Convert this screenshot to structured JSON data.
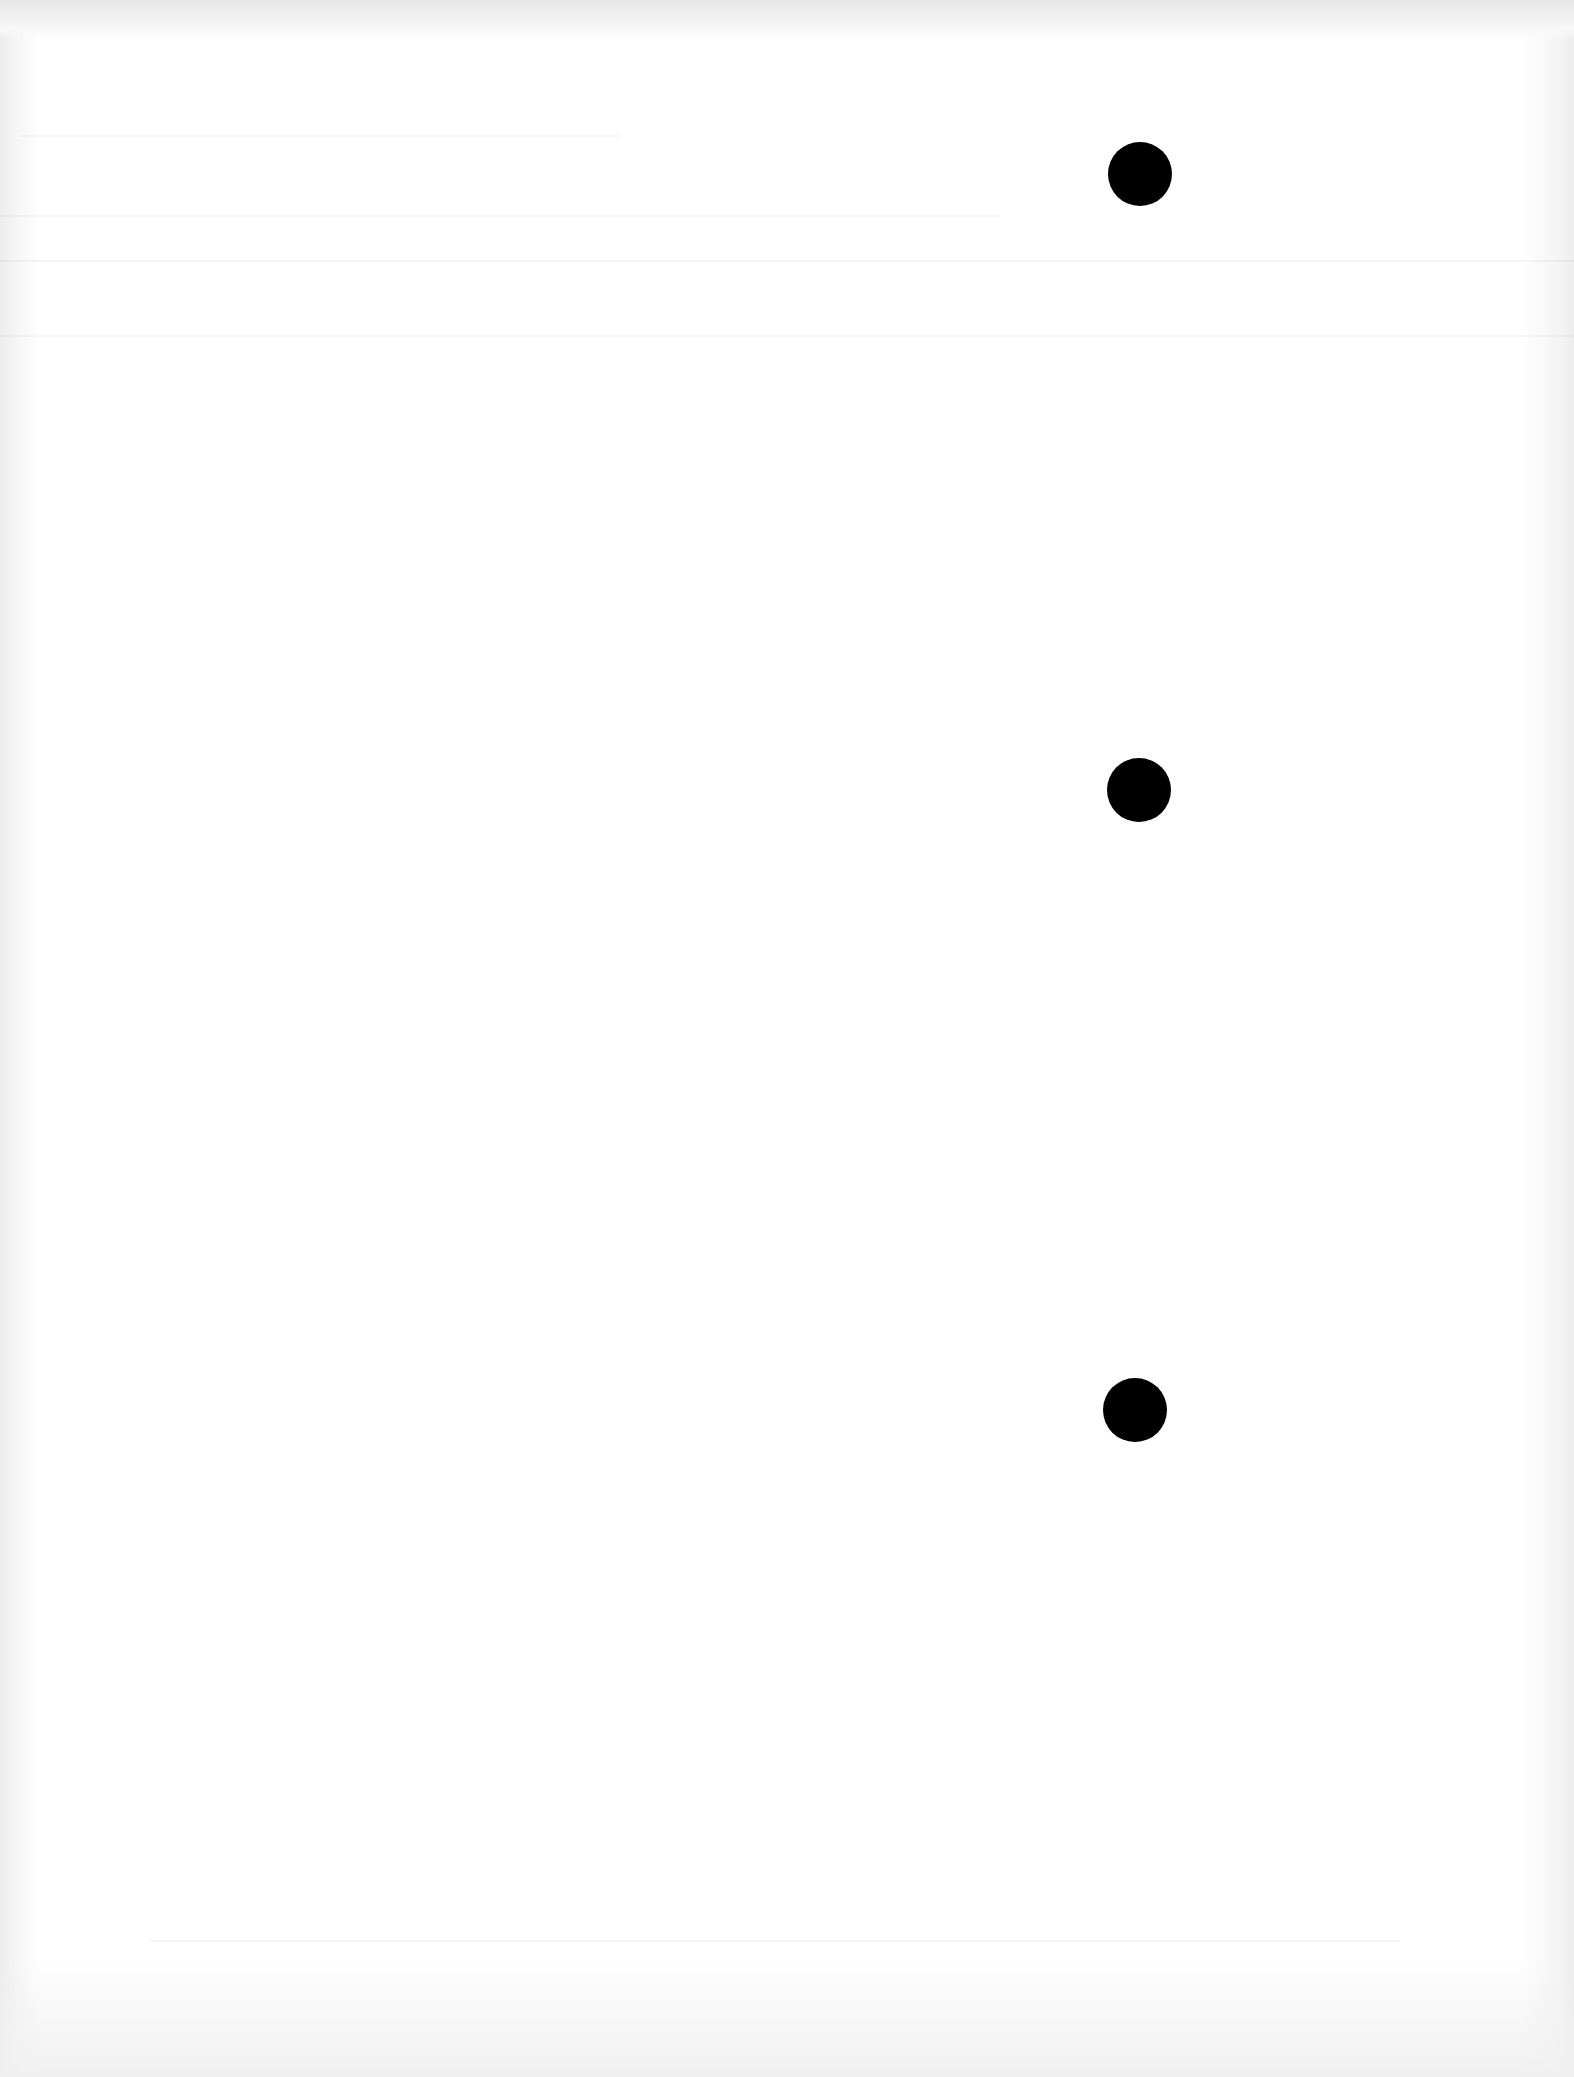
{
  "document": {
    "type": "blank scanned page",
    "background_color": "#ffffff",
    "hole_color": "#000000"
  },
  "punch_holes": [
    {
      "id": "top",
      "cx": 1140,
      "cy": 174
    },
    {
      "id": "middle",
      "cx": 1139,
      "cy": 790
    },
    {
      "id": "bottom",
      "cx": 1135,
      "cy": 1410
    }
  ]
}
